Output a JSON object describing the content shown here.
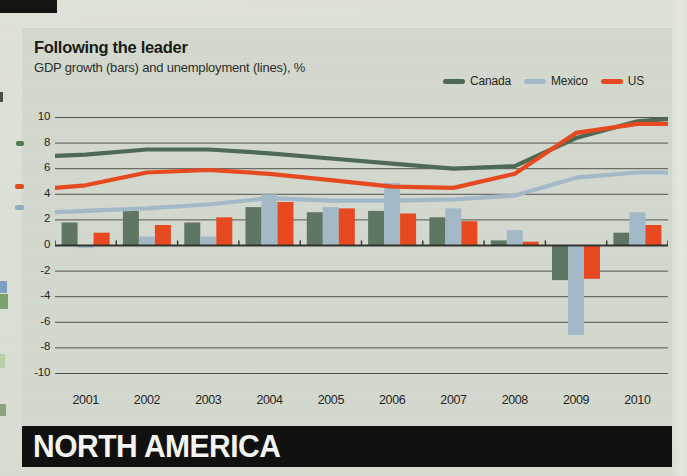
{
  "page": {
    "banner_label": "NORTH AMERICA"
  },
  "chart": {
    "title": "Following the leader",
    "subtitle": "GDP growth (bars) and unemployment (lines), %"
  },
  "colors": {
    "paper": "#dadfd5",
    "panel": "#d3d8ce",
    "banner": "#0e0f0c",
    "canada": "#5c7460",
    "mexico": "#a2b8c7",
    "us": "#e7471e",
    "grid": "#50514a",
    "zero_axis": "#2e2f29"
  },
  "chart_data": {
    "type": "bar+line",
    "title": "Following the leader",
    "subtitle": "GDP growth (bars) and unemployment (lines), %",
    "categories": [
      "2001",
      "2002",
      "2003",
      "2004",
      "2005",
      "2006",
      "2007",
      "2008",
      "2009",
      "2010"
    ],
    "ylim": [
      -10,
      10
    ],
    "y_ticks": [
      10,
      8,
      6,
      4,
      2,
      0,
      -2,
      -4,
      -6,
      -8,
      -10
    ],
    "grid": true,
    "legend_position": "top-right",
    "legend": [
      {
        "label": "Canada",
        "color": "#4d6852"
      },
      {
        "label": "Mexico",
        "color": "#a2b8c7"
      },
      {
        "label": "US",
        "color": "#e7471e"
      }
    ],
    "bar_series": [
      {
        "name": "Canada",
        "measure": "GDP growth %",
        "color": "#5c7460",
        "values": [
          1.8,
          2.7,
          1.8,
          3.0,
          2.6,
          2.7,
          2.2,
          0.4,
          -2.7,
          1.0
        ]
      },
      {
        "name": "Mexico",
        "measure": "GDP growth %",
        "color": "#a2b8c7",
        "values": [
          -0.2,
          0.7,
          0.7,
          4.0,
          3.0,
          4.9,
          2.9,
          1.2,
          -7.0,
          2.6
        ]
      },
      {
        "name": "US",
        "measure": "GDP growth %",
        "color": "#e7471e",
        "values": [
          1.0,
          1.6,
          2.2,
          3.4,
          2.9,
          2.5,
          1.9,
          0.3,
          -2.6,
          1.6
        ]
      }
    ],
    "line_series": [
      {
        "name": "Canada",
        "measure": "unemployment %",
        "color": "#4d6852",
        "values": [
          7.1,
          7.5,
          7.5,
          7.2,
          6.8,
          6.4,
          6.0,
          6.2,
          8.4,
          9.7
        ],
        "edge_start": 7.0,
        "edge_end": 9.9
      },
      {
        "name": "Mexico",
        "measure": "unemployment %",
        "color": "#a2b8c7",
        "values": [
          2.7,
          2.9,
          3.2,
          3.7,
          3.5,
          3.5,
          3.6,
          3.9,
          5.3,
          5.7
        ],
        "edge_start": 2.6,
        "edge_end": 5.7
      },
      {
        "name": "US",
        "measure": "unemployment %",
        "color": "#e7471e",
        "values": [
          4.7,
          5.7,
          5.9,
          5.6,
          5.1,
          4.6,
          4.5,
          5.6,
          8.8,
          9.5
        ],
        "edge_start": 4.5,
        "edge_end": 9.5
      }
    ]
  }
}
